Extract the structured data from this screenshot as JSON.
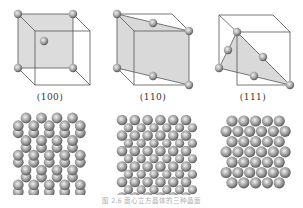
{
  "figure": {
    "caption": "图 2.6  面心立方晶体的三种晶面",
    "panels": [
      {
        "id": "100",
        "label": "(100)",
        "plane": "face-diagonal-square",
        "packing": "square",
        "rows": 5,
        "cols": 5
      },
      {
        "id": "110",
        "label": "(110)",
        "plane": "diagonal-rectangle",
        "packing": "rectangular",
        "rows": 5,
        "cols": 6
      },
      {
        "id": "111",
        "label": "(111)",
        "plane": "triangle",
        "packing": "hexagonal",
        "rows": 7,
        "cols": 5
      }
    ],
    "colors": {
      "edge": "#555555",
      "plane_fill": "#d9d9d9",
      "atom_light": "#e6e6e6",
      "atom_dark": "#5a5a5a",
      "label_text": "#333333",
      "caption_text": "#b0b0b0"
    }
  }
}
